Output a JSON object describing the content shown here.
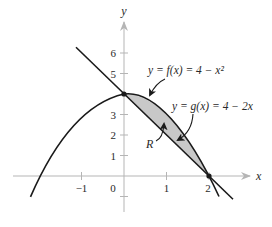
{
  "figure": {
    "axis_labels": {
      "x": "x",
      "y": "y"
    },
    "x_ticks": [
      {
        "value": -1,
        "label": "−1"
      },
      {
        "value": 0,
        "label": "0"
      },
      {
        "value": 1,
        "label": "1"
      },
      {
        "value": 2,
        "label": "2"
      }
    ],
    "y_ticks": [
      {
        "value": 1,
        "label": "1"
      },
      {
        "value": 2,
        "label": "2"
      },
      {
        "value": 3,
        "label": "3"
      },
      {
        "value": 4,
        "label": "4"
      },
      {
        "value": 5,
        "label": "5"
      },
      {
        "value": 6,
        "label": "6"
      }
    ],
    "curves": {
      "f": {
        "label": "y = f(x) = 4 − x²",
        "expression": "4 - x^2"
      },
      "g": {
        "label": "y = g(x) = 4 − 2x",
        "expression": "4 - 2x"
      }
    },
    "region_label": "R",
    "intersection_points": [
      {
        "x": 0,
        "y": 4
      },
      {
        "x": 2,
        "y": 0
      }
    ],
    "colors": {
      "curve": "#1a1a1a",
      "axis": "#b5b5b5",
      "region_fill": "#c8c8c8",
      "text": "#2a2a2a"
    }
  }
}
